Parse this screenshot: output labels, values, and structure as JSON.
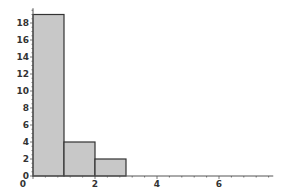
{
  "chart_data": {
    "type": "bar",
    "subtype": "histogram",
    "title": "",
    "xlabel": "",
    "ylabel": "",
    "bins": [
      {
        "x0": 0,
        "x1": 1,
        "count": 19
      },
      {
        "x0": 1,
        "x1": 2,
        "count": 4
      },
      {
        "x0": 2,
        "x1": 3,
        "count": 2
      }
    ],
    "categories": [
      "0-1",
      "1-2",
      "2-3"
    ],
    "values": [
      19,
      4,
      2
    ],
    "xlim": [
      0,
      7.75
    ],
    "ylim": [
      0,
      19.5
    ],
    "x_ticks": [
      "0",
      "2",
      "4",
      "6"
    ],
    "y_ticks": [
      "0",
      "2",
      "4",
      "6",
      "8",
      "10",
      "12",
      "14",
      "16",
      "18"
    ],
    "grid": false,
    "legend": null,
    "colors": {
      "bar_fill": "#c8c8c8",
      "bar_edge": "#333333",
      "axis": "#555555"
    }
  }
}
